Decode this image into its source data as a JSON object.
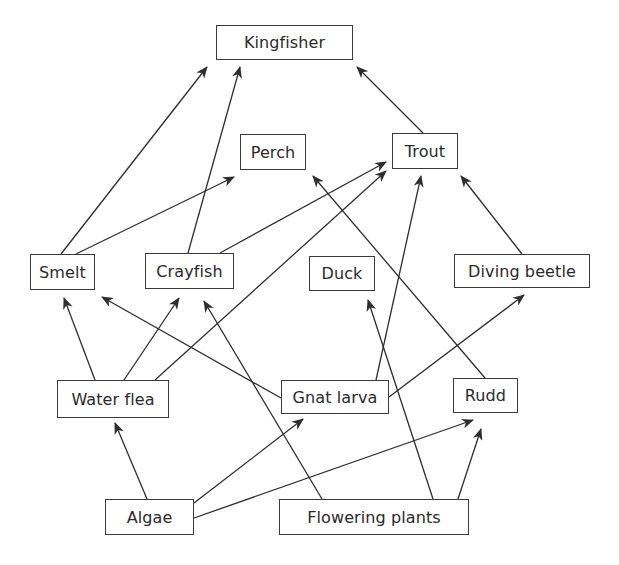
{
  "diagram": {
    "type": "food-web",
    "colors": {
      "line": "#2e2e2e",
      "box_border": "#3a3a3a",
      "text": "#2a2a2a",
      "background": "#ffffff"
    },
    "nodes": [
      {
        "id": "kingfisher",
        "label": "Kingfisher",
        "x": 216,
        "y": 25,
        "w": 137,
        "h": 35
      },
      {
        "id": "perch",
        "label": "Perch",
        "x": 240,
        "y": 134,
        "w": 66,
        "h": 36
      },
      {
        "id": "trout",
        "label": "Trout",
        "x": 392,
        "y": 133,
        "w": 66,
        "h": 36
      },
      {
        "id": "smelt",
        "label": "Smelt",
        "x": 30,
        "y": 254,
        "w": 65,
        "h": 36
      },
      {
        "id": "crayfish",
        "label": "Crayfish",
        "x": 145,
        "y": 253,
        "w": 89,
        "h": 36
      },
      {
        "id": "duck",
        "label": "Duck",
        "x": 309,
        "y": 256,
        "w": 66,
        "h": 35
      },
      {
        "id": "diving_beetle",
        "label": "Diving beetle",
        "x": 454,
        "y": 254,
        "w": 136,
        "h": 34
      },
      {
        "id": "water_flea",
        "label": "Water flea",
        "x": 57,
        "y": 380,
        "w": 112,
        "h": 38
      },
      {
        "id": "gnat_larva",
        "label": "Gnat larva",
        "x": 281,
        "y": 380,
        "w": 108,
        "h": 34
      },
      {
        "id": "rudd",
        "label": "Rudd",
        "x": 453,
        "y": 378,
        "w": 65,
        "h": 35
      },
      {
        "id": "algae",
        "label": "Algae",
        "x": 105,
        "y": 499,
        "w": 89,
        "h": 36
      },
      {
        "id": "flowering_plants",
        "label": "Flowering plants",
        "x": 279,
        "y": 499,
        "w": 190,
        "h": 36
      }
    ],
    "edges": [
      {
        "from": "smelt",
        "to": "kingfisher",
        "x1": 61,
        "y1": 254,
        "x2": 207,
        "y2": 67
      },
      {
        "from": "crayfish",
        "to": "kingfisher",
        "x1": 188,
        "y1": 253,
        "x2": 240,
        "y2": 67
      },
      {
        "from": "trout",
        "to": "kingfisher",
        "x1": 423,
        "y1": 133,
        "x2": 357,
        "y2": 67
      },
      {
        "from": "smelt",
        "to": "perch",
        "x1": 76,
        "y1": 254,
        "x2": 234,
        "y2": 177
      },
      {
        "from": "crayfish",
        "to": "trout",
        "x1": 220,
        "y1": 253,
        "x2": 386,
        "y2": 162
      },
      {
        "from": "water_flea",
        "to": "trout",
        "x1": 155,
        "y1": 380,
        "x2": 386,
        "y2": 171
      },
      {
        "from": "gnat_larva",
        "to": "trout",
        "x1": 376,
        "y1": 380,
        "x2": 421,
        "y2": 176
      },
      {
        "from": "diving_beetle",
        "to": "trout",
        "x1": 522,
        "y1": 254,
        "x2": 461,
        "y2": 176
      },
      {
        "from": "rudd",
        "to": "perch",
        "x1": 485,
        "y1": 378,
        "x2": 313,
        "y2": 176
      },
      {
        "from": "water_flea",
        "to": "smelt",
        "x1": 95,
        "y1": 380,
        "x2": 64,
        "y2": 298
      },
      {
        "from": "water_flea",
        "to": "crayfish",
        "x1": 124,
        "y1": 380,
        "x2": 179,
        "y2": 298
      },
      {
        "from": "gnat_larva",
        "to": "smelt",
        "x1": 281,
        "y1": 398,
        "x2": 102,
        "y2": 297
      },
      {
        "from": "flowering_plants",
        "to": "crayfish",
        "x1": 322,
        "y1": 499,
        "x2": 204,
        "y2": 301
      },
      {
        "from": "flowering_plants",
        "to": "duck",
        "x1": 433,
        "y1": 499,
        "x2": 368,
        "y2": 300
      },
      {
        "from": "gnat_larva",
        "to": "diving_beetle",
        "x1": 389,
        "y1": 397,
        "x2": 524,
        "y2": 295
      },
      {
        "from": "algae",
        "to": "water_flea",
        "x1": 147,
        "y1": 499,
        "x2": 115,
        "y2": 423
      },
      {
        "from": "algae",
        "to": "gnat_larva",
        "x1": 194,
        "y1": 503,
        "x2": 303,
        "y2": 419
      },
      {
        "from": "algae",
        "to": "rudd",
        "x1": 194,
        "y1": 518,
        "x2": 473,
        "y2": 420
      },
      {
        "from": "flowering_plants",
        "to": "rudd",
        "x1": 458,
        "y1": 499,
        "x2": 481,
        "y2": 429
      }
    ]
  }
}
